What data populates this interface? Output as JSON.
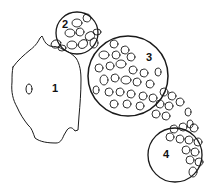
{
  "diagram": {
    "colors": {
      "stroke": "#1a1a1a",
      "background": "#ffffff"
    },
    "labels": [
      {
        "id": "1",
        "text": "1",
        "x": 52,
        "y": 92
      },
      {
        "id": "2",
        "text": "2",
        "x": 62,
        "y": 28
      },
      {
        "id": "3",
        "text": "3",
        "x": 146,
        "y": 61
      },
      {
        "id": "4",
        "text": "4",
        "x": 163,
        "y": 158
      }
    ],
    "regions": [
      {
        "id": "region-1",
        "shape": "irregular-blob",
        "label": "1"
      },
      {
        "id": "region-2",
        "shape": "circle",
        "cx": 77,
        "cy": 33,
        "r": 21,
        "label": "2"
      },
      {
        "id": "region-3",
        "shape": "circle",
        "cx": 128,
        "cy": 76,
        "r": 40,
        "label": "3"
      },
      {
        "id": "region-4",
        "shape": "circle",
        "cx": 175,
        "cy": 155,
        "r": 27,
        "label": "4"
      }
    ]
  }
}
